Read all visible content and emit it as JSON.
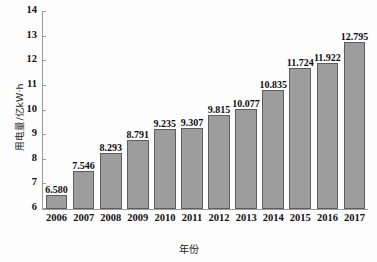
{
  "chart_data": {
    "type": "bar",
    "title": "",
    "subtitle": "",
    "xlabel": "年份",
    "ylabel": "用电量/亿kW·h",
    "categories": [
      "2006",
      "2007",
      "2008",
      "2009",
      "2010",
      "2011",
      "2012",
      "2013",
      "2014",
      "2015",
      "2016",
      "2017"
    ],
    "values": [
      6.58,
      7.546,
      8.293,
      8.791,
      9.235,
      9.307,
      9.815,
      10.077,
      10.835,
      11.724,
      11.922,
      12.795
    ],
    "value_labels": [
      "6.580",
      "7.546",
      "8.293",
      "8.791",
      "9.235",
      "9.307",
      "9.815",
      "10.077",
      "10.835",
      "11.724",
      "11.922",
      "12.795"
    ],
    "ylim": [
      6,
      14
    ],
    "yticks": [
      6,
      7,
      8,
      9,
      10,
      11,
      12,
      13,
      14
    ],
    "ytick_labels": [
      "6",
      "7",
      "8",
      "9",
      "10",
      "11",
      "12",
      "13",
      "14"
    ],
    "grid": false,
    "legend": null,
    "bar_color": "#9d9d9d",
    "bar_edge_color": "#5d5d5d",
    "axis_color": "#9a9a9a",
    "text_color": "#111111"
  }
}
